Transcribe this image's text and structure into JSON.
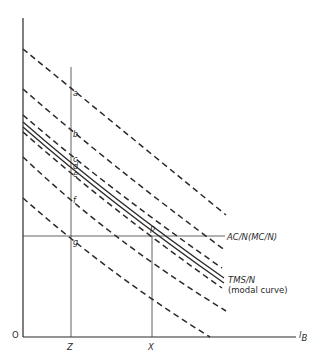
{
  "diagram": {
    "type": "economic-diagram",
    "axes": {
      "origin_label": "O",
      "x_axis_label": "l",
      "x_axis_label_sub": "B"
    },
    "vertical_markers": [
      {
        "id": "Z",
        "label": "Z"
      },
      {
        "id": "X",
        "label": "X"
      }
    ],
    "horizontal_line_label": "AC/N(MC/N)",
    "modal_curve_label_line1": "TMS/N",
    "modal_curve_label_line2": "(modal curve)",
    "points": {
      "a": "a",
      "b": "b",
      "c": "c",
      "d": "d",
      "e": "e",
      "f": "f",
      "g": "g",
      "P": "P"
    },
    "curves": [
      {
        "style": "dashed",
        "role": "highest"
      },
      {
        "style": "dashed",
        "role": "upper"
      },
      {
        "style": "dashed",
        "role": "near-modal-upper"
      },
      {
        "style": "solid",
        "role": "modal-upper"
      },
      {
        "style": "solid",
        "role": "modal-lower"
      },
      {
        "style": "dashed",
        "role": "near-modal-lower"
      },
      {
        "style": "dashed",
        "role": "lower"
      },
      {
        "style": "dashed",
        "role": "lowest"
      }
    ],
    "colors": {
      "line": "#2a2a2a",
      "background": "#ffffff"
    }
  }
}
